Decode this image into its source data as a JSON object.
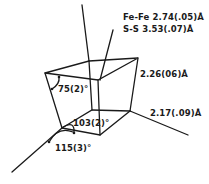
{
  "diagram": {
    "type": "molecular-geometry",
    "colors": {
      "line": "#1a1a1a",
      "background": "#ffffff"
    },
    "distances": {
      "fe_fe": "Fe-Fe  2.74(.05)Å",
      "s_s": "S-S  3.53(.07)Å",
      "bond_upper": "2.26(06)Å",
      "bond_lower": "2.17(.09)Å"
    },
    "angles": {
      "upper_left": "75(2)°",
      "lower_inner": "103(2)°",
      "lower_outer": "115(3)°"
    }
  }
}
